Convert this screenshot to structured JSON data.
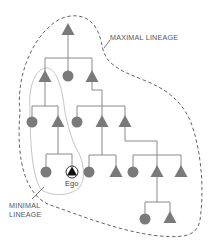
{
  "diagram": {
    "labels": {
      "maximal": "MAXIMAL LINEAGE",
      "minimal_line1": "MINIMAL",
      "minimal_line2": "LINEAGE",
      "ego": "Ego"
    },
    "colors": {
      "node_fill": "#7a7a7a",
      "line": "#8a8a8a",
      "maximal_boundary": "#666666",
      "minimal_boundary": "#bdbdbd",
      "ego_fill": "#111111",
      "label": "#555555"
    },
    "legend": {
      "triangle": "male",
      "circle": "female"
    },
    "nodes": [
      {
        "id": "g1-root",
        "shape": "triangle",
        "x": 68,
        "y": 30
      },
      {
        "id": "g2-a",
        "shape": "triangle",
        "x": 45,
        "y": 77
      },
      {
        "id": "g2-b",
        "shape": "circle",
        "x": 68,
        "y": 76
      },
      {
        "id": "g2-c",
        "shape": "triangle",
        "x": 92,
        "y": 77
      },
      {
        "id": "g3-a",
        "shape": "circle",
        "x": 32,
        "y": 122
      },
      {
        "id": "g3-b",
        "shape": "triangle",
        "x": 58,
        "y": 122
      },
      {
        "id": "g3-c",
        "shape": "circle",
        "x": 77,
        "y": 122
      },
      {
        "id": "g3-d",
        "shape": "triangle",
        "x": 102,
        "y": 122
      },
      {
        "id": "g3-e",
        "shape": "triangle",
        "x": 125,
        "y": 122
      },
      {
        "id": "g4-a",
        "shape": "circle",
        "x": 46,
        "y": 172
      },
      {
        "id": "g4-ego",
        "shape": "ego",
        "x": 72,
        "y": 172
      },
      {
        "id": "g4-c",
        "shape": "circle",
        "x": 89,
        "y": 172
      },
      {
        "id": "g4-d",
        "shape": "triangle",
        "x": 116,
        "y": 172
      },
      {
        "id": "g4-e",
        "shape": "circle",
        "x": 133,
        "y": 172
      },
      {
        "id": "g4-f",
        "shape": "triangle",
        "x": 157,
        "y": 172
      },
      {
        "id": "g4-g",
        "shape": "triangle",
        "x": 181,
        "y": 172
      },
      {
        "id": "g5-a",
        "shape": "circle",
        "x": 145,
        "y": 219
      },
      {
        "id": "g5-b",
        "shape": "triangle",
        "x": 170,
        "y": 218
      }
    ]
  }
}
